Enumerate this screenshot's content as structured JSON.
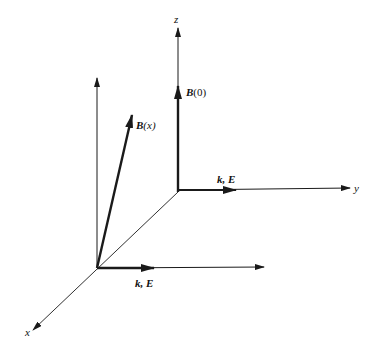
{
  "diagram": {
    "type": "3d-coordinate-vector-diagram",
    "axes": {
      "x_label": "x",
      "y_label": "y",
      "z_label": "z"
    },
    "vectors": [
      {
        "name": "B(0)",
        "symbol": "B",
        "arg": "(0)",
        "direction": "along z",
        "position": "origin"
      },
      {
        "name": "k, E (at origin)",
        "label": "k, E",
        "direction": "along y",
        "position": "origin"
      },
      {
        "name": "B(x)",
        "symbol": "B",
        "arg": "(x)",
        "direction": "tilted from vertical",
        "position": "displaced along x"
      },
      {
        "name": "k, E (displaced)",
        "label": "k, E",
        "direction": "along y",
        "position": "displaced along x"
      }
    ],
    "labels": {
      "z": "z",
      "y": "y",
      "x": "x",
      "b0_symbol": "B",
      "b0_arg": "(0)",
      "bx_symbol": "B",
      "bx_arg": "(x)",
      "ke_top": "k, E",
      "ke_bottom": "k, E"
    },
    "colors": {
      "ink": "#1a1a1a",
      "background": "#ffffff"
    }
  }
}
